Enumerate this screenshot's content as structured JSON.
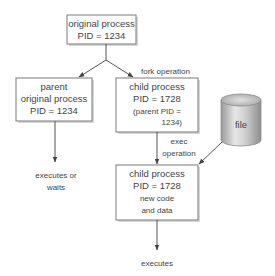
{
  "diagram": {
    "original_box": {
      "line1": "original process",
      "line2": "PID = 1234"
    },
    "parent_box": {
      "line1": "parent",
      "line2": "original process",
      "line3": "PID = 1234"
    },
    "child_box": {
      "line1": "child process",
      "line2": "PID = 1728",
      "line3": "(parent PID =",
      "line4": "1234)"
    },
    "exec_box": {
      "line1": "child process",
      "line2": "PID = 1728",
      "line3": "new code",
      "line4": "and data"
    },
    "file": {
      "label": "file"
    },
    "labels": {
      "fork": "fork operation",
      "exec_line1": "exec",
      "exec_line2": "operation",
      "parent_result_line1": "executes or",
      "parent_result_line2": "waits",
      "child_result": "executes"
    },
    "colors": {
      "box_border": "#7a7a7a",
      "line": "#555555",
      "text": "#444444",
      "cylinder": "#bdbdbd"
    }
  }
}
